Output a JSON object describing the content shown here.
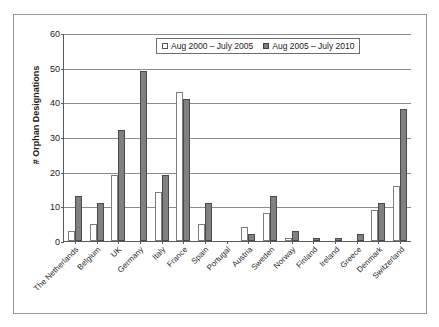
{
  "chart_data": {
    "type": "bar",
    "title": "",
    "xlabel": "",
    "ylabel": "# Orphan Designations",
    "ylim": [
      0,
      60
    ],
    "yticks": [
      0,
      10,
      20,
      30,
      40,
      50,
      60
    ],
    "grid": true,
    "legend_position": "top-center",
    "categories": [
      "The Netherlands",
      "Belgium",
      "UK",
      "Germany",
      "Italy",
      "France",
      "Spain",
      "Portugal",
      "Austria",
      "Sweden",
      "Norway",
      "Finland",
      "Ireland",
      "Greece",
      "Denmark",
      "Switzerland"
    ],
    "series": [
      {
        "name": "Aug 2000 – July 2005",
        "color": "#ffffff",
        "values": [
          3,
          5,
          19,
          0,
          14,
          43,
          5,
          0,
          4,
          8,
          1,
          0,
          0,
          0,
          9,
          16
        ]
      },
      {
        "name": "Aug 2005 – July 2010",
        "color": "#808080",
        "values": [
          13,
          11,
          32,
          49,
          19,
          41,
          11,
          0,
          2,
          13,
          3,
          1,
          1,
          2,
          11,
          38
        ]
      }
    ]
  },
  "legend": {
    "entries": [
      "Aug 2000 – July 2005",
      "Aug 2005 – July 2010"
    ]
  },
  "colors": {
    "series0_fill": "#ffffff",
    "series0_stroke": "#7d7d7d",
    "series1_fill": "#808080",
    "series1_stroke": "#4a4a4a",
    "gridline": "#8d8d8d",
    "axis": "#5a5a5a",
    "frame": "#9a9a9a"
  }
}
